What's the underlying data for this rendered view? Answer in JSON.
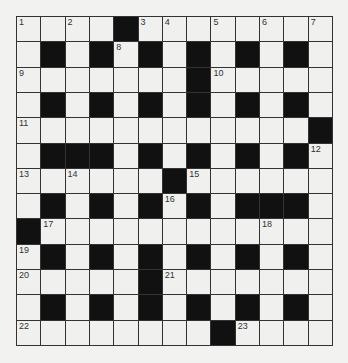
{
  "puzzle": {
    "type": "crossword",
    "rows": 13,
    "cols": 13,
    "grid": [
      [
        "1",
        "W",
        "2",
        "W",
        "B",
        "3",
        "4",
        "W",
        "5",
        "W",
        "6",
        "W",
        "7"
      ],
      [
        "W",
        "B",
        "W",
        "B",
        "8",
        "B",
        "W",
        "B",
        "W",
        "B",
        "W",
        "B",
        "W"
      ],
      [
        "9",
        "W",
        "W",
        "W",
        "W",
        "W",
        "W",
        "B",
        "10",
        "W",
        "W",
        "W",
        "W"
      ],
      [
        "W",
        "B",
        "W",
        "B",
        "W",
        "B",
        "W",
        "B",
        "W",
        "B",
        "W",
        "B",
        "W"
      ],
      [
        "11",
        "W",
        "W",
        "W",
        "W",
        "W",
        "W",
        "W",
        "W",
        "W",
        "W",
        "W",
        "B"
      ],
      [
        "W",
        "B",
        "B",
        "B",
        "W",
        "B",
        "W",
        "B",
        "W",
        "B",
        "W",
        "B",
        "12"
      ],
      [
        "13",
        "W",
        "14",
        "W",
        "W",
        "W",
        "B",
        "15",
        "W",
        "W",
        "W",
        "W",
        "W"
      ],
      [
        "W",
        "B",
        "W",
        "B",
        "W",
        "B",
        "16",
        "B",
        "W",
        "B",
        "B",
        "B",
        "W"
      ],
      [
        "B",
        "17",
        "W",
        "W",
        "W",
        "W",
        "W",
        "W",
        "W",
        "W",
        "18",
        "W",
        "W"
      ],
      [
        "19",
        "B",
        "W",
        "B",
        "W",
        "B",
        "W",
        "B",
        "W",
        "B",
        "W",
        "B",
        "W"
      ],
      [
        "20",
        "W",
        "W",
        "W",
        "W",
        "B",
        "21",
        "W",
        "W",
        "W",
        "W",
        "W",
        "W"
      ],
      [
        "W",
        "B",
        "W",
        "B",
        "W",
        "B",
        "W",
        "B",
        "W",
        "B",
        "W",
        "B",
        "W"
      ],
      [
        "22",
        "W",
        "W",
        "W",
        "W",
        "W",
        "W",
        "W",
        "B",
        "23",
        "W",
        "W",
        "W"
      ]
    ],
    "colors": {
      "black_cell": "#111111",
      "white_cell": "#f0f0ee",
      "grid_line": "#333333",
      "background": "#f2f2f0"
    }
  }
}
